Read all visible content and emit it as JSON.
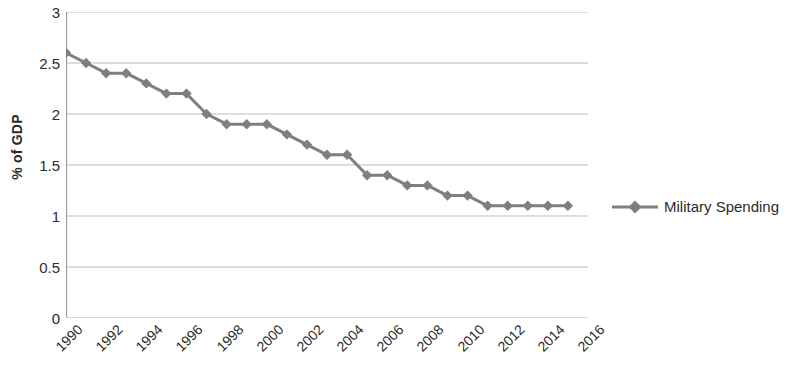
{
  "chart_data": {
    "type": "line",
    "title": "",
    "xlabel": "",
    "ylabel": "% of GDP",
    "ylim": [
      0,
      3
    ],
    "ytick_step": 0.5,
    "yticks": [
      "0",
      "0.5",
      "1",
      "1.5",
      "2",
      "2.5",
      "3"
    ],
    "xlim": [
      1990,
      2016
    ],
    "xticks": [
      "1990",
      "1992",
      "1994",
      "1996",
      "1998",
      "2000",
      "2002",
      "2004",
      "2006",
      "2008",
      "2010",
      "2012",
      "2014",
      "2016"
    ],
    "xtick_step": 2,
    "grid": "horizontal",
    "legend_position": "right",
    "marker": "diamond",
    "series": [
      {
        "name": "Military Spending",
        "color": "#7f7f7f",
        "x": [
          1990,
          1991,
          1992,
          1993,
          1994,
          1995,
          1996,
          1997,
          1998,
          1999,
          2000,
          2001,
          2002,
          2003,
          2004,
          2005,
          2006,
          2007,
          2008,
          2009,
          2010,
          2011,
          2012,
          2013,
          2014,
          2015
        ],
        "values": [
          2.6,
          2.5,
          2.4,
          2.4,
          2.3,
          2.2,
          2.2,
          2.0,
          1.9,
          1.9,
          1.9,
          1.8,
          1.7,
          1.6,
          1.6,
          1.4,
          1.4,
          1.3,
          1.3,
          1.2,
          1.2,
          1.1,
          1.1,
          1.1,
          1.1,
          1.1
        ]
      }
    ]
  },
  "legend": {
    "entries": [
      {
        "label": "Military Spending",
        "color": "#7f7f7f"
      }
    ]
  },
  "axis": {
    "y_title": "% of GDP"
  }
}
